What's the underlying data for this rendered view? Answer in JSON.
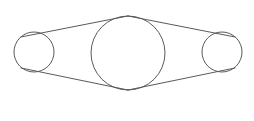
{
  "figure": {
    "kind": "line-diagram",
    "background_color": "#ffffff",
    "stroke_color": "#5a5a5a",
    "stroke_width": 1,
    "canvas": {
      "width": 254,
      "height": 121
    },
    "labels": {
      "left_circle": "",
      "center_circle": "",
      "right_circle": ""
    }
  },
  "shapes": {
    "circles": [
      {
        "name": "left-circle",
        "cx": 34,
        "cy": 52,
        "r": 20,
        "fill": "none",
        "stroke": "#5a5a5a"
      },
      {
        "name": "center-circle",
        "cx": 128,
        "cy": 53,
        "r": 37,
        "fill": "none",
        "stroke": "#5a5a5a"
      },
      {
        "name": "right-circle",
        "cx": 222,
        "cy": 52,
        "r": 20,
        "fill": "none",
        "stroke": "#5a5a5a"
      }
    ],
    "lines": [
      {
        "name": "upper-left-connector",
        "x1": 21,
        "y1": 37,
        "x2": 128,
        "y2": 16,
        "stroke": "#5a5a5a"
      },
      {
        "name": "lower-left-connector",
        "x1": 21,
        "y1": 68,
        "x2": 128,
        "y2": 90,
        "stroke": "#5a5a5a"
      },
      {
        "name": "upper-right-connector",
        "x1": 128,
        "y1": 16,
        "x2": 235,
        "y2": 37,
        "stroke": "#5a5a5a"
      },
      {
        "name": "lower-right-connector",
        "x1": 128,
        "y1": 90,
        "x2": 235,
        "y2": 68,
        "stroke": "#5a5a5a"
      }
    ],
    "vertices": [
      {
        "name": "top-apex",
        "x": 128,
        "y": 16
      },
      {
        "name": "bottom-apex",
        "x": 128,
        "y": 90
      }
    ]
  }
}
